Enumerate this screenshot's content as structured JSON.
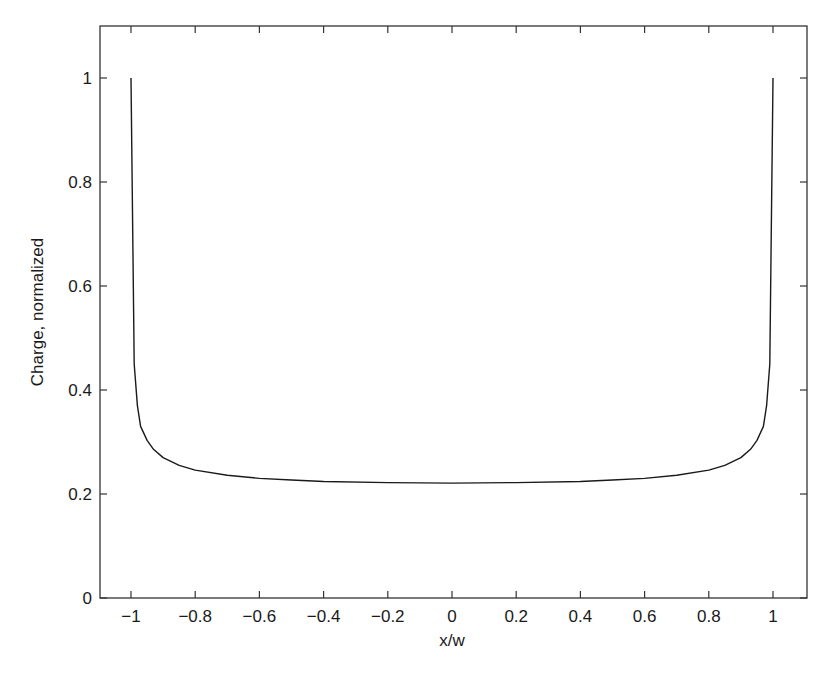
{
  "chart_data": {
    "type": "line",
    "title": "",
    "xlabel": "x/w",
    "ylabel": "Charge, normalized",
    "xlim": [
      -1.15,
      1.1
    ],
    "ylim": [
      0,
      1.1
    ],
    "xticks": [
      -1,
      -0.8,
      -0.6,
      -0.4,
      -0.2,
      0,
      0.2,
      0.4,
      0.6,
      0.8,
      1
    ],
    "xtick_labels": [
      "−1",
      "−0.8",
      "−0.6",
      "−0.4",
      "−0.2",
      "0",
      "0.2",
      "0.4",
      "0.6",
      "0.8",
      "1"
    ],
    "yticks": [
      0,
      0.2,
      0.4,
      0.6,
      0.8,
      1
    ],
    "ytick_labels": [
      "0",
      "0.2",
      "0.4",
      "0.6",
      "0.8",
      "1"
    ],
    "grid": false,
    "legend": null,
    "series": [
      {
        "name": "charge distribution",
        "color": "#1a1a1a",
        "x": [
          -1.0,
          -0.99,
          -0.98,
          -0.97,
          -0.95,
          -0.93,
          -0.9,
          -0.85,
          -0.8,
          -0.7,
          -0.6,
          -0.5,
          -0.4,
          -0.2,
          0,
          0.2,
          0.4,
          0.5,
          0.6,
          0.7,
          0.8,
          0.85,
          0.9,
          0.93,
          0.95,
          0.97,
          0.98,
          0.99,
          1.0
        ],
        "y": [
          1.0,
          0.45,
          0.37,
          0.33,
          0.303,
          0.286,
          0.27,
          0.255,
          0.246,
          0.236,
          0.23,
          0.227,
          0.224,
          0.222,
          0.221,
          0.222,
          0.224,
          0.227,
          0.23,
          0.236,
          0.246,
          0.255,
          0.27,
          0.286,
          0.303,
          0.33,
          0.37,
          0.45,
          1.0
        ]
      }
    ]
  },
  "axes": {
    "xlabel": "x/w",
    "ylabel": "Charge, normalized"
  }
}
